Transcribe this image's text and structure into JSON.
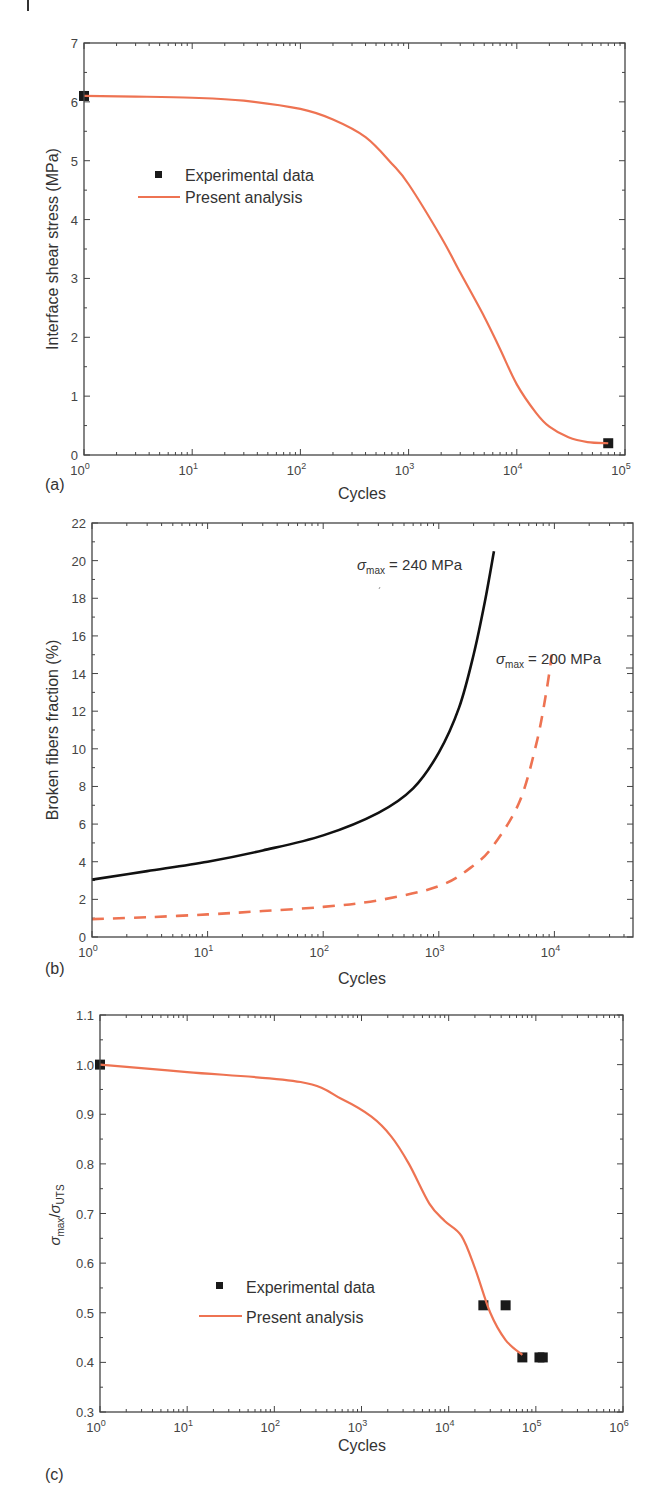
{
  "colors": {
    "analysis": "#ee7352",
    "experimental": "#1a1a1a",
    "black_curve": "#111111",
    "axis": "#444444"
  },
  "chart_data": [
    {
      "panel": "(a)",
      "type": "line",
      "xscale": "log",
      "xlabel": "Cycles",
      "ylabel": "Interface shear stress (MPa)",
      "xlim": [
        1,
        100000
      ],
      "ylim": [
        0,
        7
      ],
      "xticks": [
        "10^0",
        "10^1",
        "10^2",
        "10^3",
        "10^4",
        "10^5"
      ],
      "yticks": [
        0,
        1,
        2,
        3,
        4,
        5,
        6,
        7
      ],
      "legend": {
        "position": "upper-left",
        "entries": [
          "Experimental data",
          "Present analysis"
        ]
      },
      "series": [
        {
          "name": "Experimental data",
          "style": "square-marker",
          "x": [
            1,
            70000
          ],
          "y": [
            6.1,
            0.2
          ]
        },
        {
          "name": "Present analysis",
          "style": "solid-line",
          "x": [
            1,
            3,
            10,
            30,
            100,
            200,
            400,
            700,
            1000,
            2000,
            3000,
            5000,
            7000,
            10000,
            15000,
            20000,
            30000,
            45000,
            70000
          ],
          "y": [
            6.1,
            6.09,
            6.07,
            6.02,
            5.88,
            5.7,
            5.4,
            4.95,
            4.6,
            3.7,
            3.1,
            2.35,
            1.8,
            1.2,
            0.72,
            0.48,
            0.3,
            0.22,
            0.2
          ]
        }
      ]
    },
    {
      "panel": "(b)",
      "type": "line",
      "xscale": "log",
      "xlabel": "Cycles",
      "ylabel": "Broken fibers  fraction (%)",
      "xlim": [
        1,
        47000
      ],
      "ylim": [
        0,
        22
      ],
      "xticks": [
        "10^0",
        "10^1",
        "10^2",
        "10^3",
        "10^4"
      ],
      "yticks": [
        0,
        2,
        4,
        6,
        8,
        10,
        12,
        14,
        16,
        18,
        20,
        22
      ],
      "annotations": [
        {
          "text_symbol": "σ",
          "text_sub": "max",
          "text_rest": " = 240 MPa"
        },
        {
          "text_symbol": "σ",
          "text_sub": "max",
          "text_rest": " = 200 MPa"
        }
      ],
      "series": [
        {
          "name": "σmax = 240 MPa",
          "style": "solid-black",
          "x": [
            1,
            3,
            10,
            30,
            100,
            300,
            600,
            1000,
            1500,
            2000,
            2500,
            3000
          ],
          "y": [
            3.05,
            3.5,
            4.0,
            4.6,
            5.4,
            6.6,
            7.9,
            9.8,
            12.2,
            15.0,
            17.8,
            20.5
          ]
        },
        {
          "name": "σmax = 200 MPa",
          "style": "dashed-orange",
          "x": [
            1,
            3,
            10,
            30,
            100,
            300,
            1000,
            2000,
            3000,
            5000,
            7000,
            8500,
            9500
          ],
          "y": [
            0.95,
            1.05,
            1.2,
            1.38,
            1.6,
            1.95,
            2.7,
            3.8,
            4.9,
            7.2,
            10.3,
            13.0,
            15.0
          ]
        }
      ]
    },
    {
      "panel": "(c)",
      "type": "line",
      "xscale": "log",
      "xlabel": "Cycles",
      "ylabel": "σmax/σUTS",
      "xlim": [
        1,
        1000000
      ],
      "ylim": [
        0.3,
        1.1
      ],
      "xticks": [
        "10^0",
        "10^1",
        "10^2",
        "10^3",
        "10^4",
        "10^5",
        "10^6"
      ],
      "yticks": [
        "0.3",
        "0.4",
        "0.5",
        "0.6",
        "0.7",
        "0.8",
        "0.9",
        "1.0",
        "1.1"
      ],
      "legend": {
        "position": "lower-center-left",
        "entries": [
          "Experimental data",
          "Present analysis"
        ]
      },
      "series": [
        {
          "name": "Experimental data",
          "style": "square-marker",
          "x": [
            1,
            25000,
            45000,
            70000,
            110000,
            120000
          ],
          "y": [
            1.0,
            0.515,
            0.515,
            0.41,
            0.41,
            0.41
          ]
        },
        {
          "name": "Present analysis",
          "style": "solid-line",
          "x": [
            1,
            10,
            200,
            600,
            1300,
            2200,
            3500,
            6000,
            9000,
            14000,
            20000,
            30000,
            45000,
            70000
          ],
          "y": [
            1.0,
            0.985,
            0.965,
            0.93,
            0.895,
            0.855,
            0.8,
            0.72,
            0.685,
            0.655,
            0.59,
            0.5,
            0.445,
            0.415
          ]
        }
      ]
    }
  ],
  "labels": {
    "a": {
      "panel": "(a)",
      "xlabel": "Cycles",
      "ylabel": "Interface shear stress (MPa)",
      "legend_exp": "Experimental data",
      "legend_analysis": "Present analysis",
      "yticks": [
        "0",
        "1",
        "2",
        "3",
        "4",
        "5",
        "6",
        "7"
      ],
      "xticks_exp": [
        "0",
        "1",
        "2",
        "3",
        "4",
        "5"
      ]
    },
    "b": {
      "panel": "(b)",
      "xlabel": "Cycles",
      "ylabel": "Broken fibers  fraction (%)",
      "yticks": [
        "0",
        "2",
        "4",
        "6",
        "8",
        "10",
        "12",
        "14",
        "16",
        "18",
        "20",
        "22"
      ],
      "xticks_exp": [
        "0",
        "1",
        "2",
        "3",
        "4"
      ],
      "annot1_sym": "σ",
      "annot1_sub": "max",
      "annot1_rest": " = 240 MPa",
      "annot2_sym": "σ",
      "annot2_sub": "max",
      "annot2_rest": " = 200 MPa"
    },
    "c": {
      "panel": "(c)",
      "xlabel": "Cycles",
      "ylabel_sym1": "σ",
      "ylabel_sub1": "max",
      "ylabel_slash": "/",
      "ylabel_sym2": "σ",
      "ylabel_sub2": "UTS",
      "legend_exp": "Experimental data",
      "legend_analysis": "Present analysis",
      "yticks": [
        "0.3",
        "0.4",
        "0.5",
        "0.6",
        "0.7",
        "0.8",
        "0.9",
        "1.0",
        "1.1"
      ],
      "xticks_exp": [
        "0",
        "1",
        "2",
        "3",
        "4",
        "5",
        "6"
      ]
    },
    "ten": "10"
  }
}
